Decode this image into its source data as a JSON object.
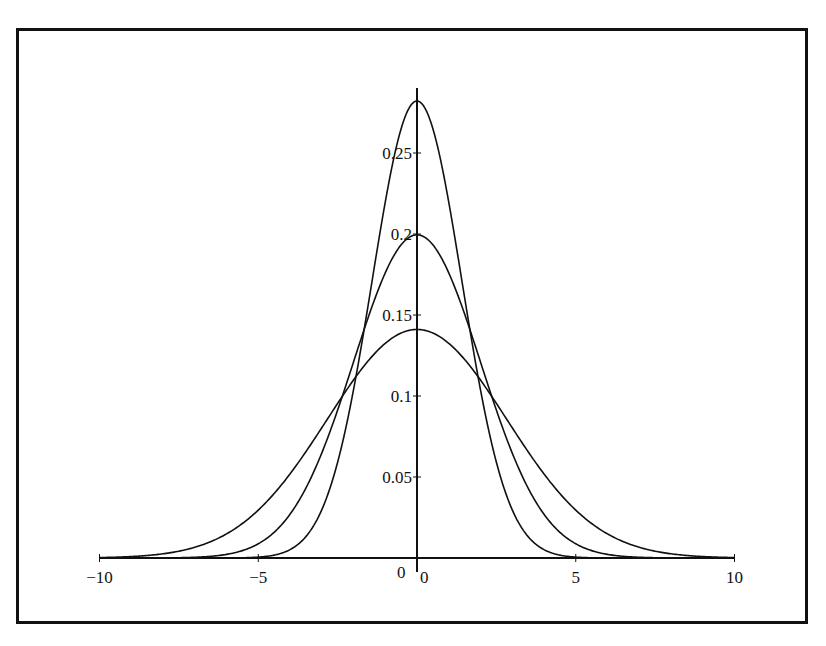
{
  "chart_data": {
    "type": "line",
    "title": "",
    "xlabel": "",
    "ylabel": "",
    "xlim": [
      -10,
      10
    ],
    "ylim": [
      0,
      0.29
    ],
    "grid": false,
    "legend": null,
    "x_ticks": [
      -10,
      -5,
      0,
      5,
      10
    ],
    "x_tick_labels": [
      "−10",
      "−5",
      "0",
      "5",
      "10"
    ],
    "y_ticks": [
      0,
      0.05,
      0.1,
      0.15,
      0.2,
      0.25
    ],
    "y_tick_labels": [
      "0",
      "0.05",
      "0.1",
      "0.15",
      "0.2",
      "0.25"
    ],
    "series": [
      {
        "name": "normal density, sigma=sqrt(2)",
        "mean": 0,
        "sigma": 1.4142,
        "peak": 0.282,
        "x": [
          -10,
          -8,
          -6,
          -5,
          -4,
          -3,
          -2,
          -1,
          0,
          1,
          2,
          3,
          4,
          5,
          6,
          8,
          10
        ],
        "y": [
          0.0,
          0.0,
          0.0001,
          0.0005,
          0.0051,
          0.0297,
          0.1038,
          0.2197,
          0.2821,
          0.2197,
          0.1038,
          0.0297,
          0.0051,
          0.0005,
          0.0001,
          0.0,
          0.0
        ]
      },
      {
        "name": "normal density, sigma=2",
        "mean": 0,
        "sigma": 2,
        "peak": 0.199,
        "x": [
          -10,
          -8,
          -6,
          -5,
          -4,
          -3,
          -2,
          -1,
          0,
          1,
          2,
          3,
          4,
          5,
          6,
          8,
          10
        ],
        "y": [
          0.0,
          0.0001,
          0.0022,
          0.0088,
          0.027,
          0.0648,
          0.121,
          0.176,
          0.1995,
          0.176,
          0.121,
          0.0648,
          0.027,
          0.0088,
          0.0022,
          0.0001,
          0.0
        ]
      },
      {
        "name": "normal density, sigma=2*sqrt(2)",
        "mean": 0,
        "sigma": 2.8284,
        "peak": 0.141,
        "x": [
          -10,
          -8,
          -6,
          -5,
          -4,
          -3,
          -2,
          -1,
          0,
          1,
          2,
          3,
          4,
          5,
          6,
          8,
          10
        ],
        "y": [
          0.0003,
          0.0026,
          0.0146,
          0.0297,
          0.0518,
          0.0799,
          0.1098,
          0.1319,
          0.141,
          0.1319,
          0.1098,
          0.0799,
          0.0518,
          0.0297,
          0.0146,
          0.0026,
          0.0003
        ]
      }
    ]
  },
  "extra_labels": {
    "origin_y_label": "0",
    "origin_x_label": "0"
  }
}
